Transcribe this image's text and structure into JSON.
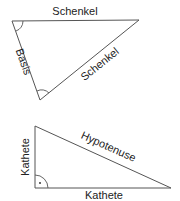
{
  "colors": {
    "line": "#555555",
    "text": "#222222",
    "background": "#ffffff"
  },
  "isosceles_triangle": {
    "label_top": "Schenkel",
    "label_left": "Basis",
    "label_right": "Schenkel",
    "angle_marks": [
      "top-left-angle",
      "bottom-angle"
    ]
  },
  "right_triangle": {
    "label_vertical": "Kathete",
    "label_bottom": "Kathete",
    "label_hypotenuse": "Hypotenuse",
    "right_angle_mark": "·"
  }
}
